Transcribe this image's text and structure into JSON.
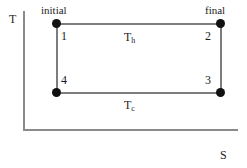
{
  "figure": {
    "type": "T-S diagram",
    "axes": {
      "y_label": "T",
      "x_label": "S"
    },
    "endpoints": {
      "initial_label": "initial",
      "final_label": "final"
    },
    "states": {
      "one": "1",
      "two": "2",
      "three": "3",
      "four": "4"
    },
    "isotherms": {
      "hot_symbol": "T",
      "hot_subscript": "h",
      "cold_symbol": "T",
      "cold_subscript": "c"
    },
    "colors": {
      "background": "#ffffff",
      "axis": "#8a8a8a",
      "cycle_edge": "#7d7d7d",
      "vertex": "#111111",
      "text": "#1c1c1c"
    }
  },
  "chart_data": {
    "type": "line",
    "title": "",
    "xlabel": "S",
    "ylabel": "T",
    "grid": false,
    "legend": "none",
    "series": [
      {
        "name": "Carnot cycle",
        "points": [
          {
            "state": "1",
            "caption": "initial",
            "x": 57,
            "y": 24
          },
          {
            "state": "2",
            "caption": "final",
            "x": 221,
            "y": 24
          },
          {
            "state": "3",
            "caption": "",
            "x": 221,
            "y": 93
          },
          {
            "state": "4",
            "caption": "",
            "x": 57,
            "y": 93
          },
          {
            "state": "1",
            "caption": "initial",
            "x": 57,
            "y": 24
          }
        ]
      }
    ],
    "annotations": [
      {
        "text": "T_h",
        "position": "top-edge-center"
      },
      {
        "text": "T_c",
        "position": "below-bottom-edge-center"
      },
      {
        "text": "initial",
        "position": "above-state-1"
      },
      {
        "text": "final",
        "position": "above-state-2"
      }
    ]
  }
}
